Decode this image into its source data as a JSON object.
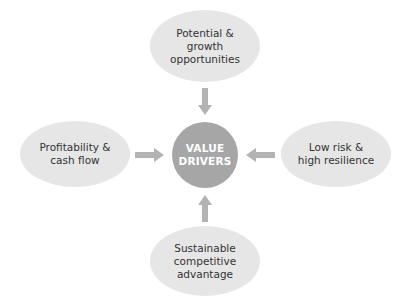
{
  "diagram": {
    "title": "Value drivers",
    "center": {
      "label_line1": "VALUE",
      "label_line2": "DRIVERS",
      "color": "#a6a6a6"
    },
    "nodes": {
      "top": {
        "line1": "Potential &",
        "line2": "growth",
        "line3": "opportunities"
      },
      "left": {
        "line1": "Profitability &",
        "line2": "cash flow"
      },
      "right": {
        "line1": "Low risk &",
        "line2": "high resilience"
      },
      "bottom": {
        "line1": "Sustainable",
        "line2": "competitive",
        "line3": "advantage"
      }
    },
    "node_color": "#e6e6e6",
    "arrow_color": "#b3b3b3",
    "edges": [
      {
        "from": "top",
        "to": "center"
      },
      {
        "from": "left",
        "to": "center"
      },
      {
        "from": "right",
        "to": "center"
      },
      {
        "from": "bottom",
        "to": "center"
      }
    ]
  }
}
